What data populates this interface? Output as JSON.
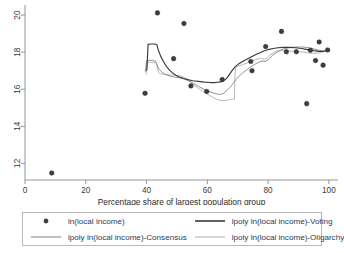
{
  "chart_data": {
    "type": "scatter",
    "title": "",
    "xlabel": "Percentage share of largest population group",
    "ylabel": "",
    "xlim": [
      0,
      103
    ],
    "ylim": [
      11.1,
      20.6
    ],
    "xticks": [
      0,
      20,
      40,
      60,
      80,
      100
    ],
    "yticks": [
      12,
      14,
      16,
      18,
      20
    ],
    "grid": false,
    "legend_position": "below-plot",
    "colors": {
      "marker": "#3c3c3c",
      "voting": "#3a3a3a",
      "consensus": "#8c8c8c",
      "oligarchy": "#b3b3b3",
      "axis": "#8a8a8a",
      "legend_text": "#23405e",
      "legend_border": "#b9b9b9"
    },
    "scatter": {
      "name": "ln(local income)",
      "points": [
        {
          "x": 8.8,
          "y": 11.48
        },
        {
          "x": 39.5,
          "y": 15.78
        },
        {
          "x": 43.6,
          "y": 20.12
        },
        {
          "x": 48.9,
          "y": 17.65
        },
        {
          "x": 52.3,
          "y": 19.55
        },
        {
          "x": 54.6,
          "y": 16.18
        },
        {
          "x": 59.8,
          "y": 15.88
        },
        {
          "x": 64.9,
          "y": 16.52
        },
        {
          "x": 74.3,
          "y": 17.5
        },
        {
          "x": 74.7,
          "y": 17.0
        },
        {
          "x": 79.2,
          "y": 18.3
        },
        {
          "x": 84.4,
          "y": 19.12
        },
        {
          "x": 86.0,
          "y": 18.02
        },
        {
          "x": 89.3,
          "y": 18.02
        },
        {
          "x": 92.7,
          "y": 15.22
        },
        {
          "x": 93.9,
          "y": 18.1
        },
        {
          "x": 95.6,
          "y": 17.55
        },
        {
          "x": 96.8,
          "y": 18.55
        },
        {
          "x": 98.1,
          "y": 17.3
        },
        {
          "x": 99.6,
          "y": 18.12
        }
      ]
    },
    "series": [
      {
        "name": "lpoly ln(local income)-Voting",
        "color": "#3a3a3a",
        "width": 1.15,
        "points": [
          [
            40.1,
            17.02
          ],
          [
            40.5,
            18.42
          ],
          [
            41.6,
            18.44
          ],
          [
            42.8,
            18.44
          ],
          [
            43.4,
            18.4
          ],
          [
            43.9,
            18.1
          ],
          [
            44.6,
            17.8
          ],
          [
            45.6,
            17.48
          ],
          [
            46.6,
            17.22
          ],
          [
            47.6,
            17.02
          ],
          [
            48.6,
            16.88
          ],
          [
            49.6,
            16.76
          ],
          [
            50.8,
            16.66
          ],
          [
            52.2,
            16.58
          ],
          [
            53.6,
            16.52
          ],
          [
            55.2,
            16.46
          ],
          [
            57.0,
            16.42
          ],
          [
            59.0,
            16.38
          ],
          [
            61.0,
            16.36
          ],
          [
            62.6,
            16.36
          ],
          [
            63.8,
            16.38
          ],
          [
            64.8,
            16.42
          ],
          [
            65.6,
            16.48
          ],
          [
            66.4,
            16.6
          ],
          [
            67.3,
            16.8
          ],
          [
            68.2,
            17.02
          ],
          [
            69.2,
            17.22
          ],
          [
            70.4,
            17.38
          ],
          [
            71.6,
            17.5
          ],
          [
            73.0,
            17.62
          ],
          [
            74.4,
            17.74
          ],
          [
            75.8,
            17.86
          ],
          [
            77.2,
            17.96
          ],
          [
            78.6,
            18.06
          ],
          [
            80.0,
            18.14
          ],
          [
            81.6,
            18.2
          ],
          [
            83.2,
            18.24
          ],
          [
            85.0,
            18.26
          ],
          [
            87.0,
            18.26
          ],
          [
            89.0,
            18.24
          ],
          [
            91.0,
            18.2
          ],
          [
            93.0,
            18.14
          ],
          [
            95.0,
            18.08
          ],
          [
            96.6,
            18.04
          ],
          [
            98.0,
            18.04
          ],
          [
            99.2,
            18.08
          ],
          [
            100.0,
            18.12
          ]
        ]
      },
      {
        "name": "lpoly ln(local income)-Consensus",
        "color": "#8c8c8c",
        "width": 0.95,
        "points": [
          [
            39.6,
            16.96
          ],
          [
            40.0,
            17.52
          ],
          [
            40.9,
            17.56
          ],
          [
            42.0,
            17.56
          ],
          [
            43.0,
            17.5
          ],
          [
            43.9,
            17.14
          ],
          [
            44.8,
            16.96
          ],
          [
            46.0,
            16.82
          ],
          [
            47.4,
            16.72
          ],
          [
            49.0,
            16.66
          ],
          [
            50.6,
            16.62
          ],
          [
            52.2,
            16.56
          ],
          [
            53.8,
            16.46
          ],
          [
            55.4,
            16.32
          ],
          [
            57.0,
            16.16
          ],
          [
            58.6,
            16.02
          ],
          [
            60.2,
            15.9
          ],
          [
            61.8,
            15.8
          ],
          [
            63.2,
            15.74
          ],
          [
            64.4,
            15.72
          ],
          [
            65.4,
            15.78
          ],
          [
            66.2,
            15.9
          ],
          [
            67.0,
            16.02
          ],
          [
            67.8,
            16.16
          ],
          [
            68.6,
            16.34
          ],
          [
            69.4,
            16.52
          ],
          [
            70.4,
            16.7
          ],
          [
            71.6,
            16.88
          ],
          [
            73.0,
            17.06
          ],
          [
            74.4,
            17.22
          ],
          [
            75.8,
            17.36
          ],
          [
            77.0,
            17.46
          ],
          [
            78.0,
            17.52
          ],
          [
            79.0,
            17.5
          ],
          [
            79.8,
            17.56
          ],
          [
            80.6,
            17.7
          ],
          [
            81.4,
            17.82
          ],
          [
            82.2,
            17.92
          ],
          [
            83.2,
            18.02
          ],
          [
            84.2,
            18.12
          ],
          [
            85.2,
            18.18
          ],
          [
            86.4,
            18.22
          ],
          [
            87.8,
            18.26
          ],
          [
            89.4,
            18.28
          ],
          [
            91.0,
            18.28
          ],
          [
            92.6,
            18.26
          ],
          [
            94.0,
            18.22
          ],
          [
            95.4,
            18.16
          ],
          [
            96.8,
            18.1
          ],
          [
            98.0,
            18.06
          ],
          [
            99.0,
            18.06
          ],
          [
            100.0,
            18.1
          ]
        ]
      },
      {
        "name": "lpoly ln(local income)-Oligarchy",
        "color": "#b3b3b3",
        "width": 0.95,
        "points": [
          [
            39.8,
            16.8
          ],
          [
            40.2,
            17.44
          ],
          [
            41.2,
            17.46
          ],
          [
            42.4,
            17.46
          ],
          [
            43.2,
            17.44
          ],
          [
            43.6,
            17.1
          ],
          [
            44.0,
            16.9
          ],
          [
            44.6,
            16.84
          ],
          [
            45.6,
            16.8
          ],
          [
            47.0,
            16.78
          ],
          [
            48.6,
            16.76
          ],
          [
            50.2,
            16.74
          ],
          [
            51.8,
            16.68
          ],
          [
            53.2,
            16.56
          ],
          [
            54.6,
            16.38
          ],
          [
            56.0,
            16.18
          ],
          [
            57.4,
            16.0
          ],
          [
            58.8,
            15.86
          ],
          [
            60.2,
            15.72
          ],
          [
            61.6,
            15.58
          ],
          [
            63.0,
            15.46
          ],
          [
            64.2,
            15.4
          ],
          [
            65.2,
            15.38
          ],
          [
            66.2,
            15.4
          ],
          [
            67.2,
            15.44
          ],
          [
            68.0,
            15.46
          ],
          [
            68.6,
            15.46
          ],
          [
            68.9,
            15.46
          ],
          [
            69.0,
            16.1
          ],
          [
            69.1,
            16.72
          ],
          [
            69.3,
            17.16
          ],
          [
            69.8,
            17.24
          ],
          [
            70.6,
            17.28
          ],
          [
            71.6,
            17.32
          ],
          [
            72.8,
            17.4
          ],
          [
            74.0,
            17.48
          ],
          [
            75.2,
            17.56
          ],
          [
            76.4,
            17.62
          ],
          [
            77.4,
            17.66
          ],
          [
            78.2,
            17.64
          ],
          [
            78.8,
            17.6
          ],
          [
            79.4,
            17.66
          ],
          [
            80.2,
            17.78
          ],
          [
            81.0,
            17.9
          ],
          [
            81.8,
            17.98
          ],
          [
            82.6,
            18.04
          ],
          [
            83.6,
            18.08
          ],
          [
            84.6,
            18.1
          ],
          [
            85.8,
            18.08
          ],
          [
            87.2,
            18.06
          ],
          [
            88.6,
            18.04
          ],
          [
            90.0,
            18.02
          ],
          [
            91.6,
            18.0
          ],
          [
            93.2,
            17.96
          ],
          [
            94.6,
            17.94
          ],
          [
            96.0,
            17.94
          ],
          [
            97.4,
            17.98
          ],
          [
            98.6,
            18.06
          ],
          [
            99.6,
            18.12
          ]
        ]
      }
    ]
  },
  "legend": {
    "entries": [
      {
        "label": "ln(local income)",
        "key": "marker",
        "color": "#3c3c3c"
      },
      {
        "label": "lpoly ln(local income)-Voting",
        "key": "line",
        "color": "#3a3a3a"
      },
      {
        "label": "lpoly ln(local income)-Consensus",
        "key": "line",
        "color": "#8c8c8c"
      },
      {
        "label": "lpoly ln(local income)-Oligarchy",
        "key": "line",
        "color": "#b3b3b3"
      }
    ]
  }
}
